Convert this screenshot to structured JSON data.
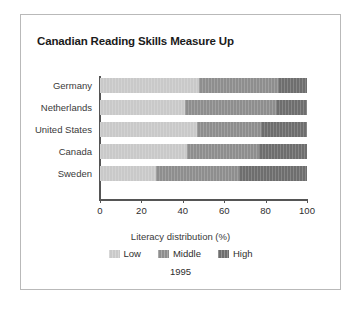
{
  "frame": {
    "border_color": "#b9b9b9",
    "background": "#ffffff"
  },
  "title": "Canadian Reading Skills Measure Up",
  "legend": {
    "title": "Literacy distribution (%)",
    "year": "1995",
    "items": [
      {
        "label": "Low",
        "color": "#c9c9c9"
      },
      {
        "label": "Middle",
        "color": "#8e8e8e"
      },
      {
        "label": "High",
        "color": "#6e6e6e"
      }
    ]
  },
  "axis": {
    "x_ticks": [
      "0",
      "20",
      "40",
      "60",
      "80",
      "100"
    ],
    "x_tick_values": [
      0,
      20,
      40,
      60,
      80,
      100
    ]
  },
  "chart_data": {
    "type": "bar",
    "orientation": "horizontal",
    "stacked": true,
    "title": "Canadian Reading Skills Measure Up",
    "subtitle": "1995",
    "xlabel": "Literacy distribution (%)",
    "ylabel": "",
    "xlim": [
      0,
      100
    ],
    "xticks": [
      0,
      20,
      40,
      60,
      80,
      100
    ],
    "grid": false,
    "legend_position": "bottom",
    "categories": [
      "Germany",
      "Netherlands",
      "United States",
      "Canada",
      "Sweden"
    ],
    "series": [
      {
        "name": "Low",
        "color": "#c9c9c9",
        "values": [
          48,
          41,
          47,
          42,
          27
        ]
      },
      {
        "name": "Middle",
        "color": "#8e8e8e",
        "values": [
          38,
          44,
          31,
          35,
          40
        ]
      },
      {
        "name": "High",
        "color": "#6e6e6e",
        "values": [
          14,
          15,
          22,
          23,
          33
        ]
      }
    ]
  }
}
